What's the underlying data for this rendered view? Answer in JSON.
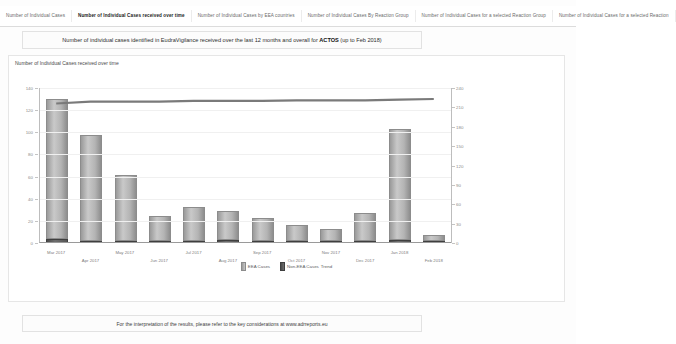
{
  "tabs": [
    {
      "label": "Number of Individual Cases",
      "active": false
    },
    {
      "label": "Number of Individual Cases received over time",
      "active": true
    },
    {
      "label": "Number of Individual Cases by EEA countries",
      "active": false
    },
    {
      "label": "Number of Individual Cases By Reaction Group",
      "active": false
    },
    {
      "label": "Number of Individual Cases for a selected Reaction Group",
      "active": false
    },
    {
      "label": "Number of Individual Cases for a selected Reaction",
      "active": false
    }
  ],
  "header": {
    "title_prefix": "Number of individual cases identified in EudraVigilance received over the last 12 months and overall for ",
    "product": "ACTOS",
    "title_suffix": " (up to Feb 2018)"
  },
  "panel": {
    "subtitle": "Number of Individual Cases received over time"
  },
  "footer": {
    "text": "For the interpretation of the results, please refer to the key considerations at www.adrreports.eu"
  },
  "legend": {
    "eea_label": "EEA Cases",
    "non_eea_label": "Non-EEA Cases",
    "trend_label": "Trend"
  },
  "colors": {
    "eea_bar": "#b4b4b4",
    "non_eea_bar": "#565656",
    "trend_line": "#7a7a7a",
    "axis": "#9a9a9a",
    "grid": "#f0f0f0",
    "text": "#5d5d5d"
  },
  "chart_data": {
    "type": "bar",
    "title": "Number of Individual Cases received over time",
    "xlabel": "",
    "ylabel": "",
    "grid": true,
    "legend_position": "bottom",
    "categories": [
      "Mar 2017",
      "Apr 2017",
      "May 2017",
      "Jun 2017",
      "Jul 2017",
      "Aug 2017",
      "Sep 2017",
      "Oct 2017",
      "Nov 2017",
      "Dec 2017",
      "Jan 2018",
      "Feb 2018"
    ],
    "series": [
      {
        "name": "EEA Cases",
        "values": [
          126,
          95,
          59,
          22,
          30,
          26,
          20,
          14,
          10,
          25,
          100,
          5
        ]
      },
      {
        "name": "Non-EEA Cases",
        "values": [
          3,
          1,
          1,
          1,
          1,
          2,
          1,
          1,
          1,
          1,
          2,
          1
        ]
      },
      {
        "name": "Trend",
        "axis": "right",
        "values": [
          216,
          219,
          219,
          219,
          220,
          220,
          220,
          221,
          221,
          221,
          222,
          223
        ]
      }
    ],
    "left_axis": {
      "ticks": [
        0,
        20,
        40,
        60,
        80,
        100,
        120,
        140
      ],
      "tick_labels": [
        "0",
        "20",
        "40",
        "60",
        "80",
        "100",
        "120",
        "140"
      ],
      "ylim": [
        0,
        140
      ]
    },
    "right_axis": {
      "ticks": [
        0,
        30,
        60,
        90,
        120,
        150,
        180,
        210,
        240
      ],
      "tick_labels": [
        "0",
        "30",
        "60",
        "90",
        "120",
        "150",
        "180",
        "210",
        "240"
      ],
      "ylim": [
        0,
        240
      ]
    }
  }
}
